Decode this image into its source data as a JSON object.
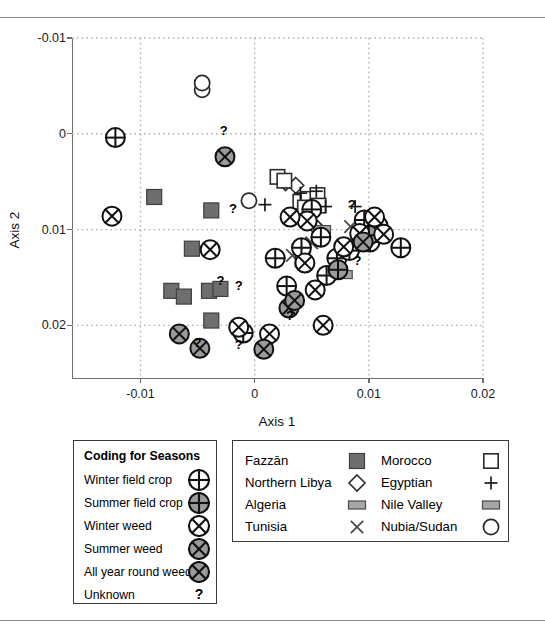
{
  "figure": {
    "axes": {
      "xlabel": "Axis 1",
      "ylabel": "Axis 2",
      "xticks": [
        "-0.01",
        "0",
        "0.01",
        "0.02"
      ],
      "yticks": [
        "0.02",
        "0.01",
        "0",
        "-0.01"
      ]
    }
  },
  "legend_seasons": {
    "title": "Coding for Seasons",
    "items": [
      {
        "label": "Winter field crop",
        "icon": "circle-plus-white-icon"
      },
      {
        "label": "Summer field crop",
        "icon": "circle-plus-grey-icon"
      },
      {
        "label": "Winter weed",
        "icon": "circle-cross-white-icon"
      },
      {
        "label": "Summer weed",
        "icon": "circle-cross-grey-icon"
      },
      {
        "label": "All year round weed",
        "icon": "circle-cross-grey-icon"
      },
      {
        "label": "Unknown",
        "icon": "question-mark-icon"
      }
    ]
  },
  "legend_regions": {
    "left": [
      {
        "label": "Fazzān",
        "icon": "filled-square-icon"
      },
      {
        "label": "Northern Libya",
        "icon": "open-diamond-icon"
      },
      {
        "label": "Algeria",
        "icon": "filled-rectangle-icon"
      },
      {
        "label": "Tunisia",
        "icon": "cross-x-icon"
      }
    ],
    "right": [
      {
        "label": "Morocco",
        "icon": "open-square-icon"
      },
      {
        "label": "Egyptian",
        "icon": "plus-icon"
      },
      {
        "label": "Nile Valley",
        "icon": "filled-rectangle-icon"
      },
      {
        "label": "Nubia/Sudan",
        "icon": "open-circle-icon"
      }
    ]
  },
  "colors": {
    "grey_fill": "#9a9a9a",
    "dark_square": "#6e6e6e",
    "stroke": "#111111",
    "grid": "#b0b0b0",
    "axis": "#6e6e6e"
  },
  "chart_data": {
    "type": "scatter",
    "title": "",
    "xlabel": "Axis 1",
    "ylabel": "Axis 2",
    "xlim": [
      -0.016,
      0.02
    ],
    "ylim": [
      -0.0155,
      0.02
    ],
    "xticks": [
      -0.01,
      0,
      0.01,
      0.02
    ],
    "yticks": [
      -0.01,
      0,
      0.01,
      0.02
    ],
    "grid": true,
    "legend_position": "below-plot",
    "series": [
      {
        "name": "Winter field crop",
        "marker": "circle-plus-white",
        "points": [
          [
            -0.0122,
            0.0096
          ],
          [
            -0.001,
            -0.0108
          ],
          [
            0.0018,
            -0.003
          ],
          [
            0.0028,
            -0.0059
          ],
          [
            0.0041,
            -0.0019
          ],
          [
            0.005,
            0.0021
          ],
          [
            0.0058,
            -0.0008
          ],
          [
            0.0063,
            -0.0048
          ],
          [
            0.0072,
            -0.003
          ],
          [
            0.0083,
            -0.0022
          ],
          [
            0.0096,
            0.001
          ],
          [
            0.0101,
            -0.0013
          ],
          [
            0.0108,
            0.0004
          ],
          [
            0.0128,
            -0.0019
          ]
        ]
      },
      {
        "name": "Summer field crop",
        "marker": "circle-plus-grey",
        "points": [
          [
            0.01,
            -0.0006
          ],
          [
            0.0073,
            -0.0042
          ]
        ]
      },
      {
        "name": "Winter weed",
        "marker": "circle-cross-white",
        "points": [
          [
            -0.0125,
            0.0014
          ],
          [
            -0.0014,
            -0.0102
          ],
          [
            0.0013,
            -0.0109
          ],
          [
            0.0044,
            -0.0035
          ],
          [
            0.0046,
            0.0009
          ],
          [
            0.0053,
            -0.0063
          ],
          [
            0.006,
            -0.01
          ],
          [
            0.0078,
            -0.0018
          ],
          [
            0.0092,
            -0.0004
          ],
          [
            0.0105,
            0.0013
          ],
          [
            0.0113,
            -0.0005
          ],
          [
            0.0031,
            0.0013
          ],
          [
            -0.0039,
            -0.0021
          ]
        ]
      },
      {
        "name": "Summer weed",
        "marker": "circle-cross-grey",
        "points": [
          [
            -0.0026,
            0.0076
          ],
          [
            -0.0066,
            -0.0109
          ],
          [
            -0.0048,
            -0.0124
          ],
          [
            0.0008,
            -0.0125
          ],
          [
            0.003,
            -0.0082
          ],
          [
            0.0095,
            -0.0013
          ]
        ]
      },
      {
        "name": "All year round weed",
        "marker": "circle-cross-grey",
        "points": [
          [
            0.0035,
            -0.0074
          ]
        ]
      },
      {
        "name": "Fazzān",
        "marker": "filled-square",
        "points": [
          [
            -0.0088,
            0.0034
          ],
          [
            -0.0038,
            0.002
          ],
          [
            -0.0055,
            -0.002
          ],
          [
            -0.0073,
            -0.0064
          ],
          [
            -0.0062,
            -0.007
          ],
          [
            -0.004,
            -0.0064
          ],
          [
            -0.003,
            -0.0062
          ],
          [
            -0.0038,
            -0.0095
          ]
        ]
      },
      {
        "name": "Northern Libya",
        "marker": "open-diamond",
        "points": [
          [
            0.0027,
            0.0049
          ],
          [
            0.0036,
            0.0046
          ],
          [
            0.0055,
            0.0001
          ]
        ]
      },
      {
        "name": "Algeria",
        "marker": "filled-rectangle",
        "points": [
          [
            0.0059,
            0.0
          ],
          [
            0.0076,
            -0.0027
          ],
          [
            0.0078,
            -0.0047
          ]
        ]
      },
      {
        "name": "Tunisia",
        "marker": "cross-x",
        "points": [
          [
            0.005,
            -0.0014
          ],
          [
            0.0033,
            -0.0027
          ],
          [
            0.0084,
            0.0003
          ]
        ]
      },
      {
        "name": "Morocco",
        "marker": "open-square",
        "points": [
          [
            0.002,
            0.0055
          ],
          [
            0.0026,
            0.0051
          ],
          [
            0.004,
            0.0029
          ],
          [
            0.0047,
            0.0032
          ],
          [
            0.0055,
            0.0036
          ],
          [
            0.0044,
            0.0023
          ],
          [
            0.0056,
            0.0025
          ],
          [
            0.0042,
            -0.0031
          ]
        ]
      },
      {
        "name": "Egyptian",
        "marker": "plus",
        "points": [
          [
            0.004,
            0.0038
          ],
          [
            0.0054,
            0.004
          ],
          [
            0.0009,
            0.0026
          ],
          [
            0.005,
            0.0024
          ],
          [
            0.0062,
            0.0024
          ],
          [
            0.0088,
            0.0024
          ]
        ]
      },
      {
        "name": "Nubia/Sudan",
        "marker": "open-circle",
        "points": [
          [
            -0.0046,
            0.0146
          ],
          [
            -0.0046,
            0.0153
          ],
          [
            -0.0005,
            0.003
          ]
        ]
      },
      {
        "name": "Unknown",
        "marker": "question-mark",
        "points": [
          [
            -0.0027,
            0.0104
          ],
          [
            -0.0019,
            0.0023
          ],
          [
            0.0031,
            -0.0089
          ],
          [
            0.0085,
            0.0027
          ],
          [
            0.009,
            -0.0032
          ],
          [
            -0.0014,
            -0.0058
          ],
          [
            -0.0014,
            -0.012
          ],
          [
            -0.005,
            -0.0117
          ],
          [
            -0.003,
            -0.0053
          ]
        ]
      }
    ]
  }
}
